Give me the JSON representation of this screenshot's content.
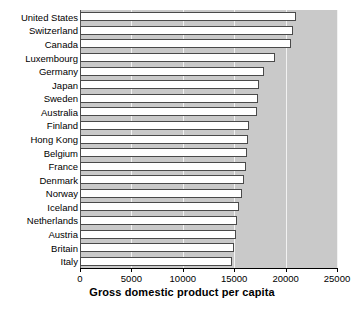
{
  "chart_data": {
    "type": "bar",
    "orientation": "horizontal",
    "title": "",
    "xlabel": "Gross domestic product per capita",
    "ylabel": "",
    "xlim": [
      0,
      25000
    ],
    "ylim": null,
    "grid": true,
    "gridlines_x": [
      5000,
      10000,
      15000,
      20000,
      25000
    ],
    "xticks": [
      0,
      5000,
      10000,
      15000,
      20000,
      25000
    ],
    "xtick_labels": [
      "0",
      "5000",
      "10000",
      "15000",
      "20000",
      "25000"
    ],
    "legend": null,
    "legend_position": "none",
    "categories": [
      "United States",
      "Switzerland",
      "Canada",
      "Luxembourg",
      "Germany",
      "Japan",
      "Sweden",
      "Australia",
      "Finland",
      "Hong Kong",
      "Belgium",
      "France",
      "Denmark",
      "Norway",
      "Iceland",
      "Netherlands",
      "Austria",
      "Britain",
      "Italy"
    ],
    "values": [
      21000,
      20700,
      20500,
      19000,
      17900,
      17400,
      17300,
      17200,
      16400,
      16300,
      16200,
      16100,
      16000,
      15800,
      15500,
      15300,
      15200,
      15000,
      14800
    ],
    "bar_facecolor": "#ffffff",
    "bar_edgecolor": "#4a4a4a",
    "panel_color": "#c9c9c9",
    "gridline_color": "#f2f2f2"
  },
  "axis": {
    "x_title": "Gross domestic product per capita"
  }
}
